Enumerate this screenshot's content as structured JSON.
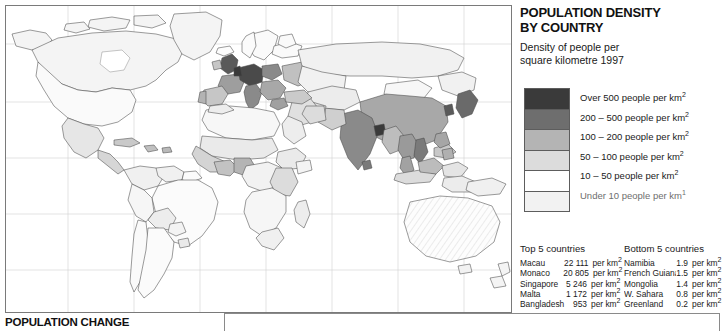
{
  "title": "POPULATION DENSITY BY COUNTRY",
  "title_line1": "POPULATION DENSITY",
  "title_line2": "BY COUNTRY",
  "subtitle_line1": "Density of people per",
  "subtitle_line2": "square kilometre 1997",
  "legend": {
    "items": [
      {
        "label": "Over 500 people per km",
        "sup": "2",
        "color": "#3a3a3a"
      },
      {
        "label": "200 – 500 people per km",
        "sup": "2",
        "color": "#6e6e6e"
      },
      {
        "label": "100 – 200 people per km",
        "sup": "2",
        "color": "#b4b4b4"
      },
      {
        "label": "50 – 100 people per km",
        "sup": "2",
        "color": "#dcdcdc"
      },
      {
        "label": "10 – 50 people per km",
        "sup": "2",
        "color": "#ffffff"
      },
      {
        "label": "Under 10 people per km",
        "sup": "1",
        "color": "#f2f2f2"
      }
    ]
  },
  "stats": {
    "head_left": "Top 5 countries",
    "head_right": "Bottom 5 countries",
    "unit": "per km",
    "unit_sup": "2",
    "top5": [
      {
        "name": "Macau",
        "value": "22 111"
      },
      {
        "name": "Monaco",
        "value": "20 805"
      },
      {
        "name": "Singapore",
        "value": "5 246"
      },
      {
        "name": "Malta",
        "value": "1 172"
      },
      {
        "name": "Bangladesh",
        "value": "953"
      }
    ],
    "bottom5": [
      {
        "name": "Namibia",
        "value": "1.9"
      },
      {
        "name": "French Guiana",
        "value": "1.5"
      },
      {
        "name": "Mongolia",
        "value": "1.4"
      },
      {
        "name": "W. Sahara",
        "value": "0.8"
      },
      {
        "name": "Greenland",
        "value": "0.2"
      }
    ],
    "uk_name": "U.K.",
    "uk_value": "243",
    "uk_unit": "per km"
  },
  "bottom_section_title": "POPULATION CHANGE",
  "map": {
    "background": "#ffffff",
    "graticule_color": "#cfcfcf",
    "outline_color": "#4a4a4a",
    "frame_color": "#7a7a7a",
    "projection": "world-equirectangular-pacific-right"
  },
  "chart_data": {
    "type": "map",
    "title": "POPULATION DENSITY BY COUNTRY",
    "subtitle": "Density of people per square kilometre 1997",
    "measure": "People per square kilometre",
    "year": 1997,
    "classes": [
      {
        "label": "Over 500 people per km2",
        "min": 500,
        "max": null,
        "color": "#3a3a3a"
      },
      {
        "label": "200 – 500 people per km2",
        "min": 200,
        "max": 500,
        "color": "#6e6e6e"
      },
      {
        "label": "100 – 200 people per km2",
        "min": 100,
        "max": 200,
        "color": "#b4b4b4"
      },
      {
        "label": "50 – 100 people per km2",
        "min": 50,
        "max": 100,
        "color": "#dcdcdc"
      },
      {
        "label": "10 – 50 people per km2",
        "min": 10,
        "max": 50,
        "color": "#ffffff"
      },
      {
        "label": "Under 10 people per km2",
        "min": 0,
        "max": 10,
        "color": "#f2f2f2"
      }
    ],
    "top5": [
      {
        "country": "Macau",
        "density": 22111
      },
      {
        "country": "Monaco",
        "density": 20805
      },
      {
        "country": "Singapore",
        "density": 5246
      },
      {
        "country": "Malta",
        "density": 1172
      },
      {
        "country": "Bangladesh",
        "density": 953
      }
    ],
    "bottom5": [
      {
        "country": "Namibia",
        "density": 1.9
      },
      {
        "country": "French Guiana",
        "density": 1.5
      },
      {
        "country": "Mongolia",
        "density": 1.4
      },
      {
        "country": "W. Sahara",
        "density": 0.8
      },
      {
        "country": "Greenland",
        "density": 0.2
      }
    ],
    "reference": {
      "country": "U.K.",
      "density": 243
    }
  }
}
